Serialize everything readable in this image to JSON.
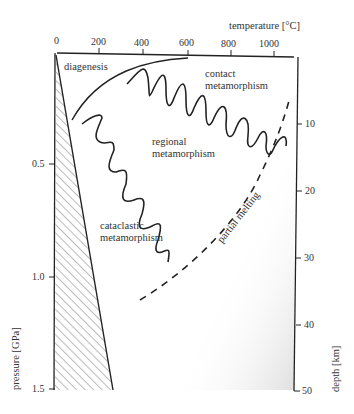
{
  "diagram": {
    "top_axis": {
      "label": "temperature [°C]",
      "ticks": [
        "0",
        "200",
        "400",
        "600",
        "800",
        "1000"
      ]
    },
    "left_axis": {
      "label": "pressure [GPa]",
      "ticks": [
        "0.5",
        "1.0",
        "1.5"
      ]
    },
    "right_axis": {
      "label": "depth [km]",
      "ticks": [
        "10",
        "20",
        "30",
        "40",
        "50"
      ]
    },
    "regions": {
      "diagenesis": "diagenesis",
      "contact_1": "contact",
      "contact_2": "metamorphism",
      "regional_1": "regional",
      "regional_2": "metamorphism",
      "cataclastic_1": "cataclastic",
      "cataclastic_2": "metamorphism",
      "partial_melting": "partial melting"
    },
    "colors": {
      "line": "#222222",
      "text": "#333333",
      "shade": "#e6e6e6"
    }
  }
}
